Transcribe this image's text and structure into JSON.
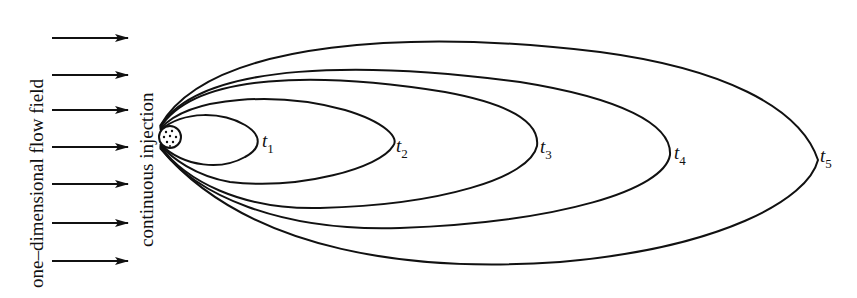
{
  "labels": {
    "flow_field": "one–dimensional   flow   field",
    "injection": "continuous   injection"
  },
  "time_labels": [
    {
      "base": "t",
      "sub": "1"
    },
    {
      "base": "t",
      "sub": "2"
    },
    {
      "base": "t",
      "sub": "3"
    },
    {
      "base": "t",
      "sub": "4"
    },
    {
      "base": "t",
      "sub": "5"
    }
  ],
  "colors": {
    "ink": "#111111",
    "background": "#ffffff"
  },
  "arrows": {
    "count": 7,
    "direction": "right"
  }
}
